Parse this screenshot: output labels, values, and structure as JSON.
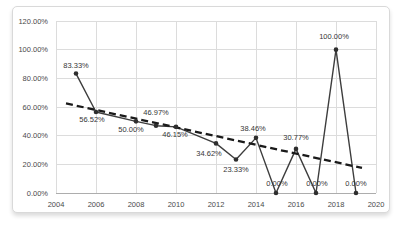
{
  "page": {
    "background": "#ffffff"
  },
  "chart_frame": {
    "background": "#ffffff",
    "border_color": "#d9d9d9"
  },
  "chart_data": {
    "type": "line",
    "title": "",
    "xlabel": "",
    "ylabel": "",
    "grid": true,
    "legend": "none",
    "x_range": [
      2004,
      2020
    ],
    "y_range": [
      0,
      120
    ],
    "x_ticks": [
      "2004",
      "2006",
      "2008",
      "2010",
      "2012",
      "2014",
      "2016",
      "2018",
      "2020"
    ],
    "y_ticks": [
      {
        "value": 0,
        "label": "0.00%"
      },
      {
        "value": 20,
        "label": "20.00%"
      },
      {
        "value": 40,
        "label": "40.00%"
      },
      {
        "value": 60,
        "label": "60.00%"
      },
      {
        "value": 80,
        "label": "80.00%"
      },
      {
        "value": 100,
        "label": "100.00%"
      },
      {
        "value": 120,
        "label": "120.00%"
      }
    ],
    "series": [
      {
        "name": "percent-by-year",
        "line_color": "#3d3d3d",
        "marker_color": "#2e2e2e",
        "points": [
          {
            "year": 2005,
            "value": 83.33,
            "label": "83.33%",
            "label_pos": "above",
            "dx": 0,
            "dy": -6
          },
          {
            "year": 2006,
            "value": 56.52,
            "label": "56.52%",
            "label_pos": "below",
            "dx": -4,
            "dy": 10
          },
          {
            "year": 2008,
            "value": 50.0,
            "label": "50.00%",
            "label_pos": "below",
            "dx": -5,
            "dy": 11
          },
          {
            "year": 2009,
            "value": 46.97,
            "label": "46.97%",
            "label_pos": "above",
            "dx": 0,
            "dy": -11
          },
          {
            "year": 2010,
            "value": 46.15,
            "label": "46.15%",
            "label_pos": "below",
            "dx": -1,
            "dy": 10
          },
          {
            "year": 2012,
            "value": 34.62,
            "label": "34.62%",
            "label_pos": "below",
            "dx": -7,
            "dy": 13
          },
          {
            "year": 2013,
            "value": 23.33,
            "label": "23.33%",
            "label_pos": "below",
            "dx": 0,
            "dy": 12
          },
          {
            "year": 2014,
            "value": 38.46,
            "label": "38.46%",
            "label_pos": "above",
            "dx": -3,
            "dy": -7
          },
          {
            "year": 2015,
            "value": 0.0,
            "label": "0.00%",
            "label_pos": "above",
            "dx": 1,
            "dy": -7
          },
          {
            "year": 2016,
            "value": 30.77,
            "label": "30.77%",
            "label_pos": "above",
            "dx": 0,
            "dy": -9
          },
          {
            "year": 2017,
            "value": 0.0,
            "label": "0.00%",
            "label_pos": "above",
            "dx": 1,
            "dy": -7
          },
          {
            "year": 2018,
            "value": 100.0,
            "label": "100.00%",
            "label_pos": "above",
            "dx": -2,
            "dy": -11
          },
          {
            "year": 2019,
            "value": 0.0,
            "label": "0.00%",
            "label_pos": "above",
            "dx": 0,
            "dy": -7
          }
        ]
      }
    ],
    "trendline": {
      "type": "linear",
      "style": "dashed",
      "color": "#1a1a1a",
      "width": 2.3,
      "dash": "7 4",
      "x_start": 2004.5,
      "v_start": 62.5,
      "x_end": 2019.3,
      "v_end": 17.5
    },
    "colors": {
      "gridline": "#dcdcdc",
      "axis_line": "#adadad",
      "tick_text": "#4a4a4a",
      "label_text": "#363636"
    }
  }
}
